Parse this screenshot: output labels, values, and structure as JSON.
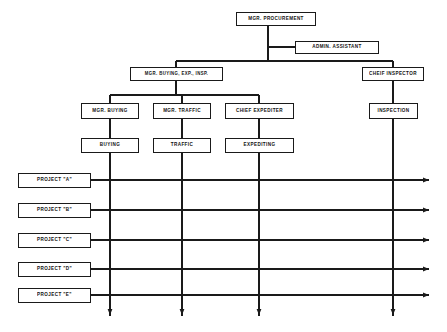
{
  "diagram": {
    "type": "org-chart",
    "line_color": "#1a1a1a",
    "box_fill": "#ffffff",
    "background": "#ffffff"
  },
  "nodes": {
    "mgr_procurement": {
      "label": "MGR. PROCUREMENT",
      "x": 236,
      "y": 12,
      "w": 80,
      "h": 14
    },
    "admin_assistant": {
      "label": "ADMIN. ASSISTANT",
      "x": 295,
      "y": 41,
      "w": 84,
      "h": 13
    },
    "mgr_buying_exp_insp": {
      "label": "MGR. BUYING, EXP., INSP.",
      "x": 130,
      "y": 67,
      "w": 93,
      "h": 14
    },
    "cheif_inspector": {
      "label": "CHEIF INSPECTOR",
      "x": 362,
      "y": 67,
      "w": 62,
      "h": 14
    },
    "mgr_buying": {
      "label": "MGR. BUYING",
      "x": 81,
      "y": 103,
      "w": 58,
      "h": 16
    },
    "mgr_traffic": {
      "label": "MGR. TRAFFIC",
      "x": 153,
      "y": 103,
      "w": 58,
      "h": 16
    },
    "chief_expediter": {
      "label": "CHIEF EXPEDITER",
      "x": 225,
      "y": 103,
      "w": 69,
      "h": 16
    },
    "inspection": {
      "label": "INSPECTION",
      "x": 369,
      "y": 103,
      "w": 49,
      "h": 16
    },
    "buying": {
      "label": "BUYING",
      "x": 81,
      "y": 138,
      "w": 58,
      "h": 15
    },
    "traffic": {
      "label": "TRAFFIC",
      "x": 153,
      "y": 138,
      "w": 58,
      "h": 15
    },
    "expediting": {
      "label": "EXPEDITING",
      "x": 225,
      "y": 138,
      "w": 69,
      "h": 15
    }
  },
  "projects": [
    {
      "label": "PROJECT \"A\"",
      "x": 18,
      "y": 173,
      "w": 73,
      "h": 15
    },
    {
      "label": "PROJECT \"B\"",
      "x": 18,
      "y": 203,
      "w": 73,
      "h": 15
    },
    {
      "label": "PROJECT \"C\"",
      "x": 18,
      "y": 233,
      "w": 73,
      "h": 15
    },
    {
      "label": "PROJECT \"D\"",
      "x": 18,
      "y": 262,
      "w": 73,
      "h": 15
    },
    {
      "label": "PROJECT \"E\"",
      "x": 18,
      "y": 288,
      "w": 73,
      "h": 15
    }
  ],
  "connectors": {
    "root_drop_x": 268,
    "bus_y": 61,
    "bus_left_x": 176,
    "bus_right_x": 393,
    "admin_stub_y": 47,
    "sub_bus_y": 95,
    "sub_bus_left_x": 110,
    "sub_bus_right_x": 259,
    "column_x": [
      110,
      182,
      259,
      393
    ],
    "project_line_right_x": 433,
    "project_line_ys": [
      180,
      210,
      240,
      269,
      295
    ],
    "down_arrow_y": 320
  }
}
